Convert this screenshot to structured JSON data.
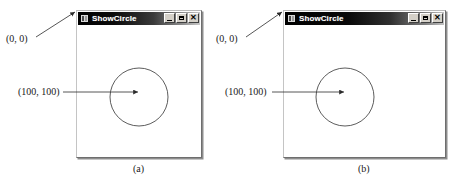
{
  "figure": {
    "caption_a": "(a)",
    "caption_b": "(b)"
  },
  "windows": [
    {
      "id": "a",
      "title": "ShowCircle",
      "icon": "app-window-icon",
      "buttons": {
        "minimize": "_",
        "maximize": "□",
        "close": "✕"
      },
      "annotations": {
        "origin": "(0, 0)",
        "center": "(100, 100)"
      }
    },
    {
      "id": "b",
      "title": "ShowCircle",
      "icon": "app-window-icon",
      "buttons": {
        "minimize": "_",
        "maximize": "□",
        "close": "✕"
      },
      "annotations": {
        "origin": "(0, 0)",
        "center": "(100, 100)"
      }
    }
  ],
  "colors": {
    "titlebar_dark": "#000000",
    "titlebar_light": "#c9c9c9",
    "title_text": "#ffffff",
    "client_background": "#ffffff",
    "stroke": "#333333",
    "border_shadow": "#8d8d8d"
  }
}
